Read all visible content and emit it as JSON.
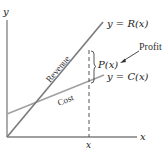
{
  "diagram": {
    "type": "revenue-cost-profit",
    "axes": {
      "x_label": "x",
      "y_label": "y",
      "x_tick_label": "x"
    },
    "lines": [
      {
        "name": "Revenue",
        "equation": "y = R(x)",
        "color": "#7a7a7a"
      },
      {
        "name": "Cost",
        "equation": "y = C(x)",
        "color": "#9a9a9a"
      }
    ],
    "annotations": {
      "profit_label": "Profit",
      "profit_function": "P(x)"
    },
    "colors": {
      "axis": "#7f7f7f",
      "revenue_line": "#7a7a7a",
      "cost_line": "#a0a0a0",
      "dashed_line": "#555555",
      "text": "#222222"
    }
  }
}
